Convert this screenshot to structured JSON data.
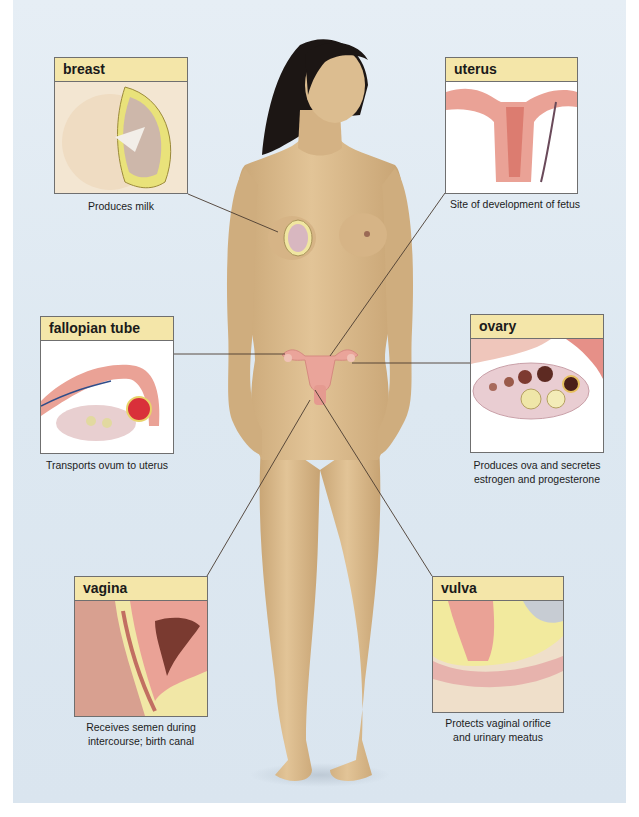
{
  "figure": {
    "colors": {
      "background": "#dde8f1",
      "label_header": "#f4e6a9",
      "border": "#6f6f6f",
      "skin": "#d9b98a",
      "hair": "#1c1614",
      "organ_pink": "#eaa49a",
      "leader_line": "#4a3b30"
    },
    "callouts": [
      {
        "id": "breast",
        "label": "breast",
        "caption_lines": [
          "Produces milk"
        ]
      },
      {
        "id": "uterus",
        "label": "uterus",
        "caption_lines": [
          "Site of development of fetus"
        ]
      },
      {
        "id": "fallopian-tube",
        "label": "fallopian tube",
        "caption_lines": [
          "Transports ovum to uterus"
        ]
      },
      {
        "id": "ovary",
        "label": "ovary",
        "caption_lines": [
          "Produces ova and secretes",
          "estrogen and progesterone"
        ]
      },
      {
        "id": "vagina",
        "label": "vagina",
        "caption_lines": [
          "Receives semen during",
          "intercourse; birth canal"
        ]
      },
      {
        "id": "vulva",
        "label": "vulva",
        "caption_lines": [
          "Protects vaginal orifice",
          "and urinary meatus"
        ]
      }
    ]
  }
}
